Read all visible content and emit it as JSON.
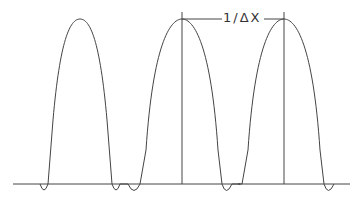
{
  "diagram": {
    "label": "1/ΔX",
    "peaks_x": [
      80,
      182,
      284
    ],
    "baseline_y": 184,
    "peak_y": 19,
    "colors": {
      "line": "#444444",
      "background": "#ffffff"
    }
  }
}
